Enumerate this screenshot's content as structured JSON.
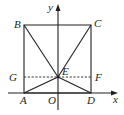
{
  "figure": {
    "axes": {
      "x_label": "x",
      "y_label": "y",
      "origin_label": "O"
    },
    "points": {
      "A": "A",
      "B": "B",
      "C": "C",
      "D": "D",
      "E": "E",
      "F": "F",
      "G": "G"
    }
  }
}
